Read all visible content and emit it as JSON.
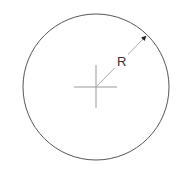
{
  "diagram": {
    "type": "circle-radius",
    "label": "R",
    "circle": {
      "cx": 96,
      "cy": 87,
      "r": 73,
      "stroke": "#555555"
    },
    "crosshair": {
      "stroke": "#888888"
    },
    "radius_line": {
      "stroke": "#aaaaaa",
      "arrow": "#222222"
    }
  }
}
